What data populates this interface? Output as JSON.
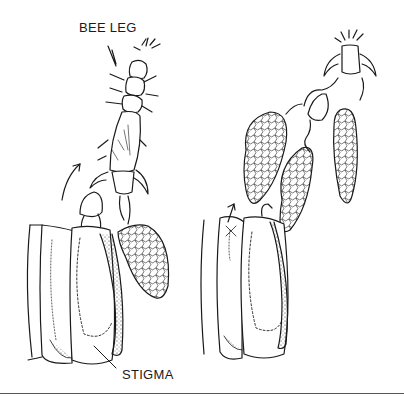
{
  "figure": {
    "panels": [
      {
        "id": "left",
        "label_top": "BEE LEG",
        "label_bottom": "STIGMA",
        "description": "Bee leg hooking pollinia from the flower column; arrow shows upward pull"
      },
      {
        "id": "right",
        "description": "Bee leg carrying three pollinia away from the flower"
      }
    ],
    "colors": {
      "ink": "#1a1a1a",
      "background": "#ffffff",
      "rule": "#555555"
    }
  }
}
